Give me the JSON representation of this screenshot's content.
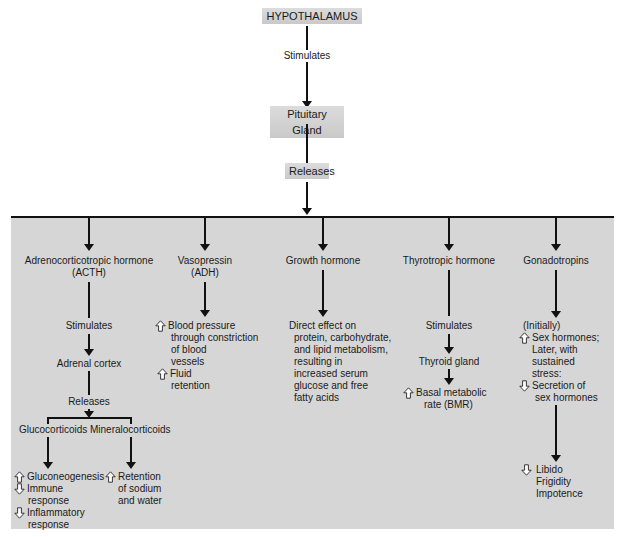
{
  "top_chain": {
    "hypothalamus": "HYPOTHALAMUS",
    "stimulates": "Stimulates",
    "pituitary": "Pituitary Gland",
    "releases": "Releases"
  },
  "columns": {
    "acth": {
      "title_1": "Adrenocorticotropic hormone",
      "title_2": "(ACTH)",
      "stimulates": "Stimulates",
      "adrenal": "Adrenal cortex",
      "releases": "Releases",
      "gluco": "Glucocorticoids",
      "mineralo": "Mineralocorticoids",
      "gluco_effects": [
        {
          "dir": "up",
          "lines": [
            "Gluconeogenesis"
          ]
        },
        {
          "dir": "down",
          "lines": [
            "Immune",
            "response"
          ]
        },
        {
          "dir": "down",
          "lines": [
            "Inflammatory",
            "response"
          ]
        }
      ],
      "mineralo_effects": [
        {
          "dir": "up",
          "lines": [
            "Retention",
            "of sodium",
            "and water"
          ]
        }
      ]
    },
    "adh": {
      "title_1": "Vasopressin",
      "title_2": "(ADH)",
      "effects": [
        {
          "dir": "up",
          "lines": [
            "Blood pressure",
            "through constriction",
            "of blood",
            "vessels"
          ]
        },
        {
          "dir": "up",
          "lines": [
            "Fluid",
            "retention"
          ]
        }
      ]
    },
    "gh": {
      "title": "Growth hormone",
      "effect_lines": [
        "Direct effect on",
        "protein, carbohydrate,",
        "and lipid metabolism,",
        "resulting in",
        "increased serum",
        "glucose and free",
        "fatty acids"
      ]
    },
    "tsh": {
      "title": "Thyrotropic hormone",
      "stimulates": "Stimulates",
      "thyroid": "Thyroid gland",
      "effect": {
        "dir": "up",
        "lines": [
          "Basal metabolic",
          "rate (BMR)"
        ]
      }
    },
    "gonad": {
      "title": "Gonadotropins",
      "initially": "(Initially)",
      "effect_1": {
        "dir": "up",
        "lines": [
          "Sex hormones;",
          "Later, with",
          "sustained",
          "stress:"
        ]
      },
      "effect_2": {
        "dir": "down",
        "lines": [
          "Secretion of",
          "sex hormones"
        ]
      },
      "effect_3": {
        "dir": "down",
        "lines": [
          "Libido",
          "Frigidity",
          "Impotence"
        ]
      }
    }
  },
  "colors": {
    "panel": "#d6d6d6",
    "line": "#111111",
    "box": "#d0d0d0"
  }
}
